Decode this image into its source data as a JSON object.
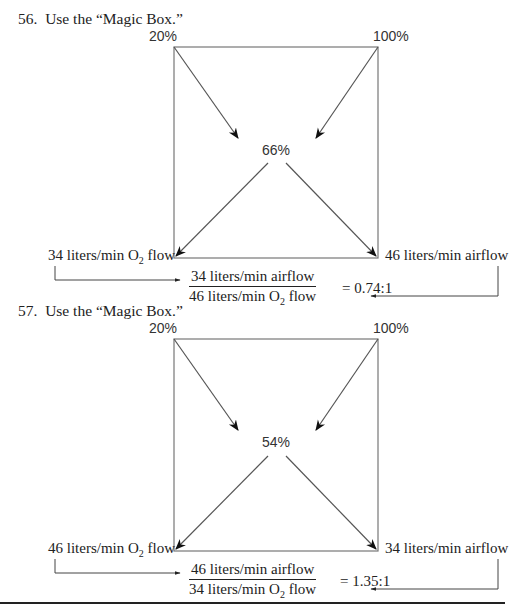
{
  "problems": [
    {
      "number": "56.",
      "instruction": "Use the “Magic Box.”",
      "top_left": "20%",
      "top_right": "100%",
      "center": "66%",
      "bottom_left_pre": "34 liters/min O",
      "bottom_left_sub": "2",
      "bottom_left_post": " flow",
      "bottom_right": "46 liters/min airflow",
      "fraction_num": "34 liters/min airflow",
      "fraction_den_pre": "46 liters/min O",
      "fraction_den_sub": "2",
      "fraction_den_post": " flow",
      "result": "= 0.74:1"
    },
    {
      "number": "57.",
      "instruction": "Use the “Magic Box.”",
      "top_left": "20%",
      "top_right": "100%",
      "center": "54%",
      "bottom_left_pre": "46 liters/min O",
      "bottom_left_sub": "2",
      "bottom_left_post": " flow",
      "bottom_right": "34 liters/min airflow",
      "fraction_num": "46 liters/min airflow",
      "fraction_den_pre": "34 liters/min O",
      "fraction_den_sub": "2",
      "fraction_den_post": " flow",
      "result": "= 1.35:1"
    }
  ]
}
